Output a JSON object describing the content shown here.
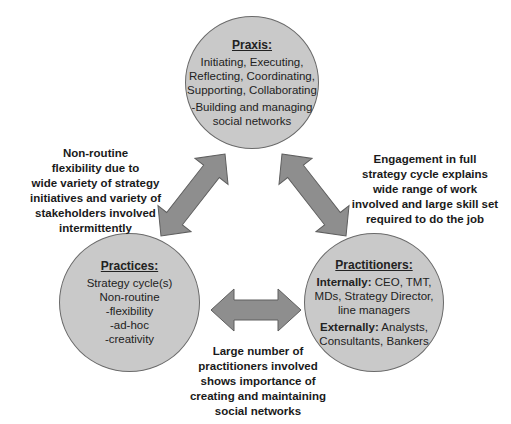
{
  "colors": {
    "circle_fill": "#c9c9c9",
    "circle_stroke": "#6a6a6a",
    "arrow_fill": "#8e8e8e",
    "arrow_stroke": "#5e5e5e",
    "text": "#1a1a1a"
  },
  "nodes": {
    "praxis": {
      "title": "Praxis:",
      "lines": [
        "Initiating, Executing,",
        "Reflecting, Coordinating,",
        "Supporting, Collaborating",
        "-Building and managing",
        "social networks"
      ]
    },
    "practices": {
      "title": "Practices:",
      "lines": [
        "Strategy cycle(s)",
        "Non-routine",
        "-flexibility",
        "-ad-hoc",
        "-creativity"
      ]
    },
    "practitioners": {
      "title": "Practitioners:",
      "internal_label": "Internally:",
      "internal_lines": [
        " CEO, TMT,",
        "MDs, Strategy Director,",
        "line managers"
      ],
      "external_label": "Externally:",
      "external_lines": [
        " Analysts,",
        "Consultants, Bankers"
      ]
    }
  },
  "notes": {
    "left": {
      "lines": [
        "Non-routine",
        "flexibility due to",
        "wide variety of strategy",
        "initiatives and variety of",
        "stakeholders involved",
        "intermittently"
      ]
    },
    "right": {
      "lines": [
        "Engagement in full",
        "strategy cycle explains",
        "wide range of work",
        "involved and large skill set",
        "required to do the job"
      ]
    },
    "bottom": {
      "lines": [
        "Large number of",
        "practitioners involved",
        "shows importance of",
        "creating and maintaining",
        "social networks"
      ]
    }
  },
  "edges": [
    {
      "from": "praxis",
      "to": "practices",
      "type": "bidirectional-arrow"
    },
    {
      "from": "praxis",
      "to": "practitioners",
      "type": "bidirectional-arrow"
    },
    {
      "from": "practices",
      "to": "practitioners",
      "type": "bidirectional-arrow"
    }
  ]
}
